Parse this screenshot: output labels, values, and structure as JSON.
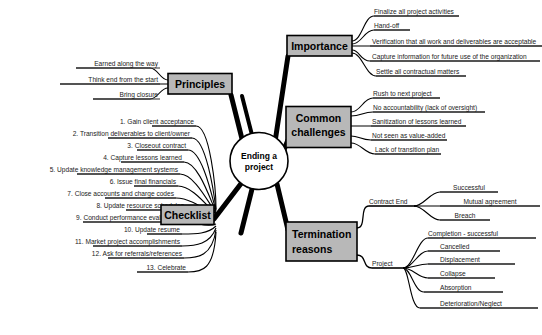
{
  "diagram": {
    "title": "Ending a project",
    "type": "mind-map",
    "colors": {
      "node_fill": "#b8b8b8",
      "node_border": "#000000",
      "background": "#ffffff",
      "line": "#000000",
      "text": "#000000"
    },
    "center": {
      "label_line1": "Ending a",
      "label_line2": "project"
    },
    "branches": [
      {
        "id": "principles",
        "label": "Principles",
        "side": "left",
        "children": [
          {
            "label": "Earned along the way"
          },
          {
            "label": "Think end from the start"
          },
          {
            "label": "Bring closure"
          }
        ]
      },
      {
        "id": "checklist",
        "label": "Checklist",
        "side": "left",
        "children": [
          {
            "label": "1.  Gain client acceptance"
          },
          {
            "label": "2. Transition deliverables to client/owner"
          },
          {
            "label": "3. Closeout contract"
          },
          {
            "label": "4.  Capture lessons learned"
          },
          {
            "label": "5. Update knowledge management systems"
          },
          {
            "label": "6. Issue final financials"
          },
          {
            "label": "7.  Close accounts and charge codes"
          },
          {
            "label": "8.  Update resource schedules"
          },
          {
            "label": "9. Conduct performance evaluations"
          },
          {
            "label": "10. Update resume"
          },
          {
            "label": "11. Market project accomplishments"
          },
          {
            "label": "12.  Ask for referrals/references"
          },
          {
            "label": "13. Celebrate"
          }
        ]
      },
      {
        "id": "importance",
        "label": "Importance",
        "side": "right",
        "children": [
          {
            "label": "Finalize all project activities"
          },
          {
            "label": "Hand-off"
          },
          {
            "label": "Verification that all work and deliverables are acceptable"
          },
          {
            "label": "Capture information for future use of the organization"
          },
          {
            "label": "Settle all contractual matters"
          }
        ]
      },
      {
        "id": "common-challenges",
        "label_line1": "Common",
        "label_line2": "challenges",
        "label": "Common challenges",
        "side": "right",
        "children": [
          {
            "label": "Rush to next project"
          },
          {
            "label": "No accountability (lack of oversight)"
          },
          {
            "label": "Sanitization of lessons learned"
          },
          {
            "label": "Not seen as value-added"
          },
          {
            "label": "Lack of transition plan"
          }
        ]
      },
      {
        "id": "termination-reasons",
        "label_line1": "Termination",
        "label_line2": "reasons",
        "label": "Termination reasons",
        "side": "right",
        "groups": [
          {
            "id": "contract-end",
            "label": "Contract End",
            "children": [
              {
                "label": "Successful"
              },
              {
                "label": "Mutual agreement"
              },
              {
                "label": "Breach"
              }
            ]
          },
          {
            "id": "project",
            "label": "Project",
            "children": [
              {
                "label": "Completion - successful"
              },
              {
                "label": "Cancelled"
              },
              {
                "label": "Displacement"
              },
              {
                "label": "Collapse"
              },
              {
                "label": "Absorption"
              },
              {
                "label": "Deterioration/Neglect"
              }
            ]
          }
        ]
      }
    ]
  }
}
